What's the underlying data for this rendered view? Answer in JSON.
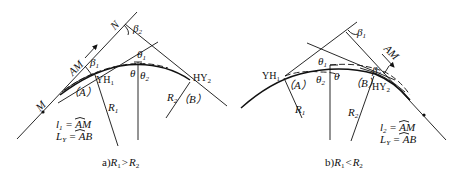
{
  "figure": {
    "panel_a": {
      "caption": "a)R₁ > R₂",
      "caption_prefix": "a)",
      "caption_r1": "R",
      "caption_r1_sub": "1",
      "caption_op": ">",
      "caption_r2": "R",
      "caption_r2_sub": "2",
      "labels": {
        "N": "N",
        "beta2": "β",
        "beta2_sub": "2",
        "beta1": "β",
        "beta1_sub": "1",
        "AM": "AM",
        "M": "M",
        "A": "（A）",
        "B": "（B）",
        "YH1": "YH",
        "YH1_sub": "1",
        "HY2": "HY",
        "HY2_sub": "2",
        "R1": "R",
        "R1_sub": "1",
        "R2": "R",
        "R2_sub": "2",
        "theta": "θ",
        "theta1": "θ",
        "theta1_sub": "1",
        "theta2": "θ",
        "theta2_sub": "2"
      },
      "formulas": {
        "l_line": "l₁ = AM̑",
        "l_lhs": "l",
        "l_sub": "1",
        "l_rhs": "AM",
        "L_lhs": "L",
        "L_sub": "Y",
        "L_rhs": "AB"
      }
    },
    "panel_b": {
      "caption": "b)R₁ < R₂",
      "caption_prefix": "b)",
      "caption_r1": "R",
      "caption_r1_sub": "1",
      "caption_op": "<",
      "caption_r2": "R",
      "caption_r2_sub": "2",
      "labels": {
        "beta1": "β",
        "beta1_sub": "1",
        "beta2": "β",
        "beta2_sub": "2",
        "AM": "AM",
        "A": "（A）",
        "B": "（B）",
        "YH1": "YH",
        "YH1_sub": "1",
        "HY2": "HY",
        "HY2_sub": "2",
        "R1": "R",
        "R1_sub": "1",
        "R2": "R",
        "R2_sub": "2",
        "theta": "θ",
        "theta1": "θ",
        "theta1_sub": "1",
        "theta2": "θ",
        "theta2_sub": "2"
      },
      "formulas": {
        "l_lhs": "l",
        "l_sub": "2",
        "l_rhs": "AM",
        "L_lhs": "L",
        "L_sub": "Y",
        "L_rhs": "AB"
      }
    }
  }
}
